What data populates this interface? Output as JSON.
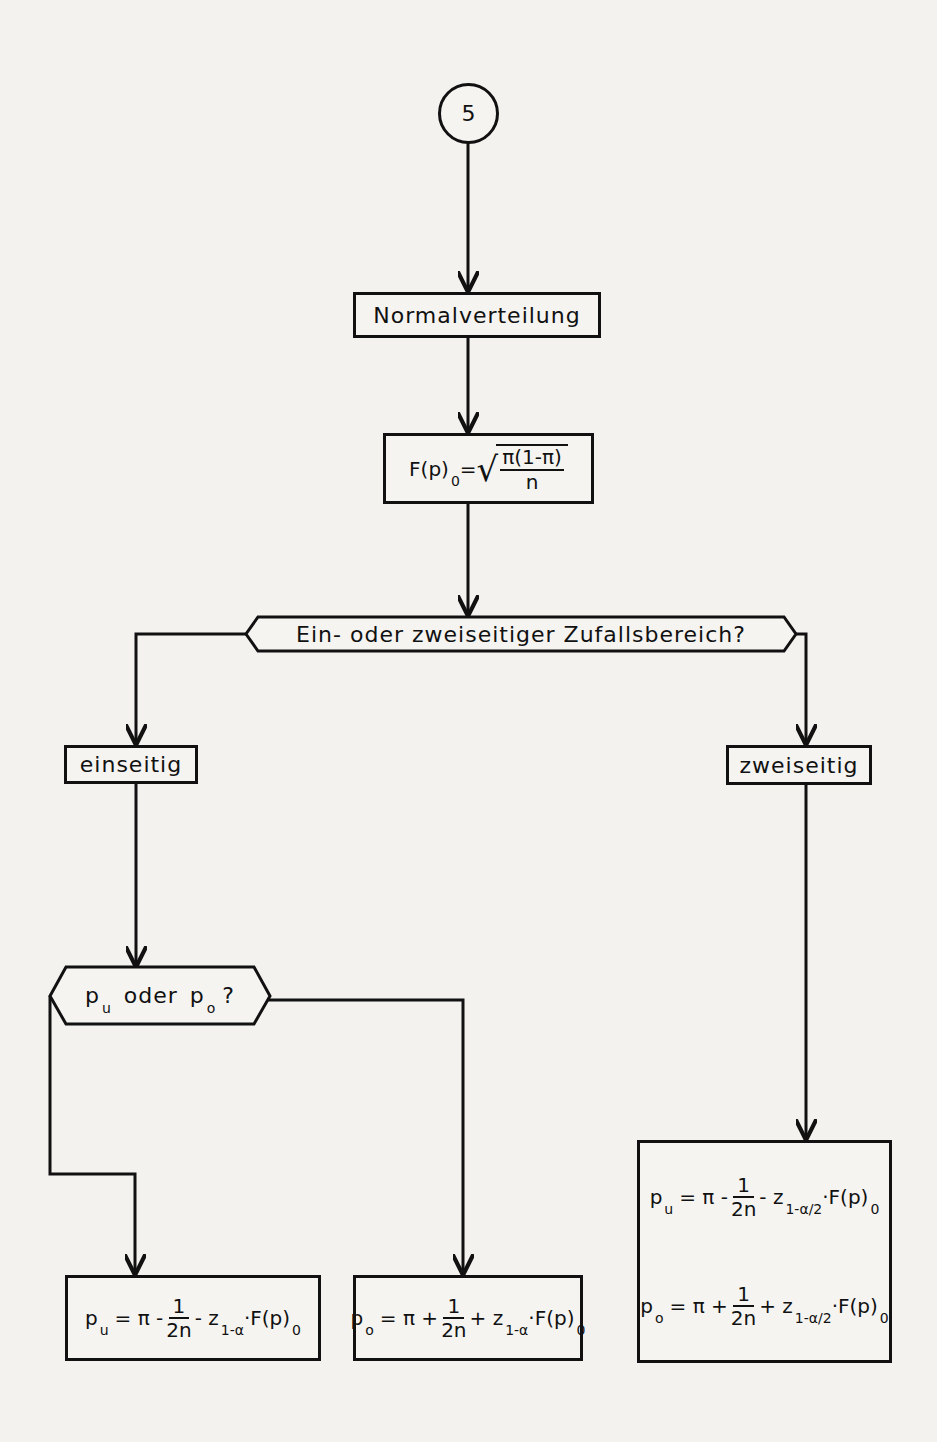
{
  "diagram": {
    "type": "flowchart",
    "connector": {
      "label": "5"
    },
    "nodes": {
      "distribution": {
        "label": "Normalverteilung"
      },
      "std_error": {
        "lhs": "F(p)",
        "lhs_sub": "0",
        "eq": "=",
        "radicand_num": "π(1-π)",
        "radicand_den": "n"
      },
      "decision_sides": {
        "label": "Ein- oder zweiseitiger Zufallsbereich?"
      },
      "one_sided": {
        "label": "einseitig"
      },
      "two_sided": {
        "label": "zweiseitig"
      },
      "decision_bound": {
        "p1": "p",
        "p1_sub": "u",
        "middle": "oder",
        "p2": "p",
        "p2_sub": "o",
        "q": "?"
      },
      "formula_lower_one_sided": {
        "lhs": "p",
        "lhs_sub": "u",
        "rhs_start": "= π -",
        "frac_num": "1",
        "frac_den": "2n",
        "z_part": "- z",
        "z_sub": "1-α",
        "tail": "·F(p)",
        "tail_sub": "0"
      },
      "formula_upper_one_sided": {
        "lhs": "p",
        "lhs_sub": "o",
        "rhs_start": "= π +",
        "frac_num": "1",
        "frac_den": "2n",
        "z_part": "+ z",
        "z_sub": "1-α",
        "tail": "·F(p)",
        "tail_sub": "0"
      },
      "formula_two_sided_lower": {
        "lhs": "p",
        "lhs_sub": "u",
        "rhs_start": "= π -",
        "frac_num": "1",
        "frac_den": "2n",
        "z_part": "- z",
        "z_sub": "1-α/2",
        "tail": "·F(p)",
        "tail_sub": "0"
      },
      "formula_two_sided_upper": {
        "lhs": "p",
        "lhs_sub": "o",
        "rhs_start": "= π +",
        "frac_num": "1",
        "frac_den": "2n",
        "z_part": "+ z",
        "z_sub": "1-α/2",
        "tail": "·F(p)",
        "tail_sub": "0"
      }
    },
    "colors": {
      "ink": "#111111",
      "paper": "#f3f2ef"
    }
  }
}
